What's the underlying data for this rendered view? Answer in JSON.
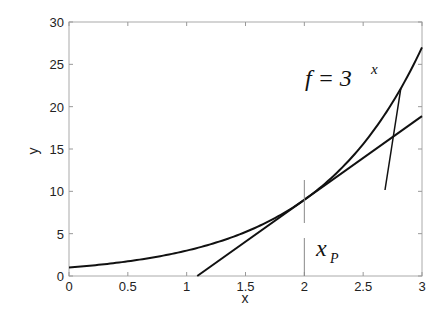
{
  "chart_data": {
    "type": "line",
    "title": "",
    "xlabel": "x",
    "ylabel": "y",
    "xlim": [
      0,
      3
    ],
    "ylim": [
      0,
      30
    ],
    "xticks": [
      0,
      0.5,
      1,
      1.5,
      2,
      2.5,
      3
    ],
    "xtick_labels": [
      "0",
      "0.5",
      "1",
      "1.5",
      "2",
      "2.5",
      "3"
    ],
    "yticks": [
      0,
      5,
      10,
      15,
      20,
      25,
      30
    ],
    "ytick_labels": [
      "0",
      "5",
      "10",
      "15",
      "20",
      "25",
      "30"
    ],
    "grid": false,
    "series": [
      {
        "name": "f = 3^x",
        "function": "3^x",
        "x": [
          0,
          0.25,
          0.5,
          0.75,
          1,
          1.25,
          1.5,
          1.75,
          2,
          2.25,
          2.5,
          2.75,
          3
        ],
        "values": [
          1,
          1.316,
          1.732,
          2.28,
          3,
          3.948,
          5.196,
          6.839,
          9,
          11.845,
          15.588,
          20.515,
          27
        ]
      },
      {
        "name": "tangent at x = 2",
        "function": "9 + 9.888*(x-2)",
        "x": [
          1.09,
          3
        ],
        "values": [
          0,
          18.89
        ]
      }
    ],
    "annotations": [
      {
        "text_main": "f = 3",
        "text_sup": "x",
        "target_x": 2.82,
        "note": "curve label with leader line"
      },
      {
        "text_main": "x",
        "text_sub": "P",
        "at_x": 2,
        "note": "vertical marker at tangent point"
      }
    ]
  },
  "labels": {
    "curve_label_main": "f = 3",
    "curve_label_sup": "x",
    "point_label_main": "x",
    "point_label_sub": "P"
  }
}
